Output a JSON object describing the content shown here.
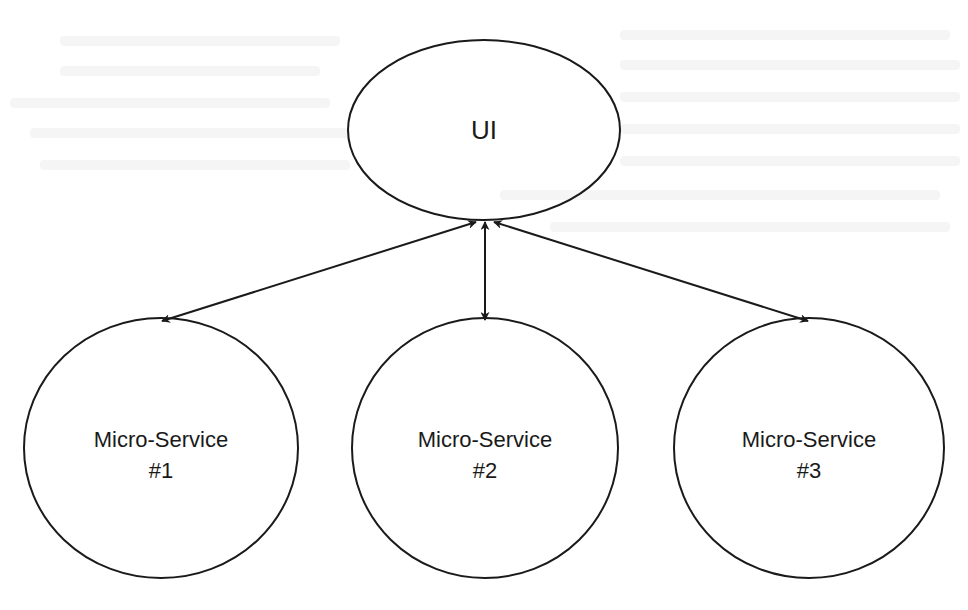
{
  "diagram": {
    "type": "architecture",
    "stroke_color": "#1a1a1a",
    "background": "#ffffff",
    "nodes": [
      {
        "id": "ui",
        "label": "UI",
        "lines": [
          "UI"
        ],
        "shape": "ellipse",
        "cx": 484,
        "cy": 130,
        "rx": 136,
        "ry": 90
      },
      {
        "id": "ms1",
        "label": "Micro-Service #1",
        "lines": [
          "Micro-Service",
          "#1"
        ],
        "shape": "ellipse",
        "cx": 161,
        "cy": 448,
        "rx": 137,
        "ry": 130
      },
      {
        "id": "ms2",
        "label": "Micro-Service #2",
        "lines": [
          "Micro-Service",
          "#2"
        ],
        "shape": "ellipse",
        "cx": 485,
        "cy": 448,
        "rx": 133,
        "ry": 130
      },
      {
        "id": "ms3",
        "label": "Micro-Service #3",
        "lines": [
          "Micro-Service",
          "#3"
        ],
        "shape": "ellipse",
        "cx": 809,
        "cy": 448,
        "rx": 135,
        "ry": 130
      }
    ],
    "edges": [
      {
        "from": "ui",
        "to": "ms1",
        "direction": "both"
      },
      {
        "from": "ui",
        "to": "ms2",
        "direction": "both"
      },
      {
        "from": "ui",
        "to": "ms3",
        "direction": "both"
      }
    ]
  }
}
